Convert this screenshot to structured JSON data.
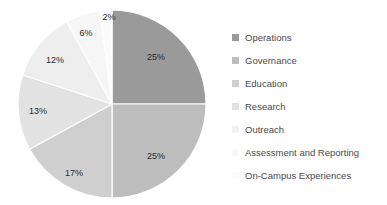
{
  "chart_data": {
    "type": "pie",
    "title": "",
    "legend_position": "right",
    "grid": false,
    "start_angle_deg": 0,
    "direction": "clockwise",
    "categories": [
      "Operations",
      "Governance",
      "Education",
      "Research",
      "Outreach",
      "Assessment and Reporting",
      "On-Campus Experiences"
    ],
    "values": [
      25,
      25,
      17,
      13,
      12,
      6,
      2
    ],
    "value_labels": [
      "25%",
      "25%",
      "17%",
      "13%",
      "12%",
      "6%",
      "2%"
    ],
    "colors": [
      "#9a9a9a",
      "#bdbdbd",
      "#cfcfcf",
      "#e2e2e2",
      "#eeeeee",
      "#f6f6f6",
      "#fbfbfb"
    ],
    "slices": [
      {
        "label": "Operations",
        "value": 25,
        "value_label": "25%",
        "color": "#9a9a9a",
        "label_x": 156,
        "label_y": 57
      },
      {
        "label": "Governance",
        "value": 25,
        "value_label": "25%",
        "color": "#bdbdbd",
        "label_x": 156,
        "label_y": 156
      },
      {
        "label": "Education",
        "value": 17,
        "value_label": "17%",
        "color": "#cfcfcf",
        "label_x": 74,
        "label_y": 173
      },
      {
        "label": "Research",
        "value": 13,
        "value_label": "13%",
        "color": "#e2e2e2",
        "label_x": 38,
        "label_y": 111
      },
      {
        "label": "Outreach",
        "value": 12,
        "value_label": "12%",
        "color": "#eeeeee",
        "label_x": 55,
        "label_y": 60
      },
      {
        "label": "Assessment and Reporting",
        "value": 6,
        "value_label": "6%",
        "color": "#f6f6f6",
        "label_x": 86,
        "label_y": 33
      },
      {
        "label": "On-Campus Experiences",
        "value": 2,
        "value_label": "2%",
        "color": "#fbfbfb",
        "label_x": 109,
        "label_y": 17
      }
    ],
    "geometry": {
      "center_x": 112,
      "center_y": 104,
      "radius": 94
    }
  },
  "legend": {
    "items": [
      {
        "label": "Operations",
        "color": "#9a9a9a"
      },
      {
        "label": "Governance",
        "color": "#bdbdbd"
      },
      {
        "label": "Education",
        "color": "#cfcfcf"
      },
      {
        "label": "Research",
        "color": "#e2e2e2"
      },
      {
        "label": "Outreach",
        "color": "#f2f2f2"
      },
      {
        "label": "Assessment and Reporting",
        "color": "#f9f9f9"
      },
      {
        "label": "On-Campus Experiences",
        "color": "#fcfcfc"
      }
    ]
  }
}
